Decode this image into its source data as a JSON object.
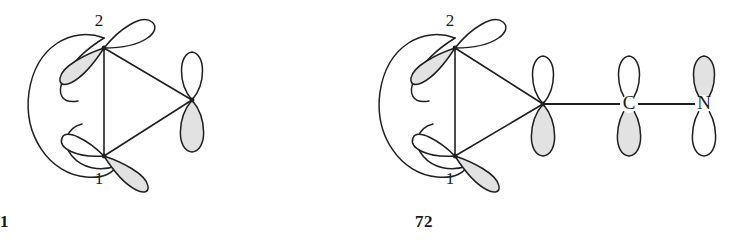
{
  "figure": {
    "background_color": "#ffffff",
    "line_color": "#1f1f1f",
    "lobe_shade_color": "#e2e2e2",
    "lobe_empty_color": "#ffffff"
  },
  "structures": [
    {
      "id": "71",
      "caption": "71",
      "description": "Three-membered ring with p-orbitals at each vertex and an outer orbital envelope on the left",
      "position_labels": [
        {
          "text": "2",
          "vertex": "top-left"
        },
        {
          "text": "1",
          "vertex": "bottom-left"
        }
      ],
      "vertices": [
        {
          "name": "vertex-2",
          "label": "2",
          "orbital": "p",
          "orientation": "tilted",
          "shaded_lobe": "lower-left",
          "empty_lobe": "upper-right"
        },
        {
          "name": "vertex-1",
          "label": "1",
          "orbital": "p",
          "orientation": "tilted",
          "shaded_lobe": "lower-right",
          "empty_lobe": "upper-left"
        },
        {
          "name": "vertex-right",
          "label": "",
          "orbital": "p",
          "orientation": "vertical",
          "shaded_lobe": "bottom",
          "empty_lobe": "top"
        }
      ],
      "bonds": [
        {
          "from": "vertex-2",
          "to": "vertex-1",
          "kind": "ring"
        },
        {
          "from": "vertex-2",
          "to": "vertex-right",
          "kind": "ring"
        },
        {
          "from": "vertex-1",
          "to": "vertex-right",
          "kind": "ring"
        }
      ],
      "envelope": "left-side closed orbital envelope enclosing the back lobes of vertices 1 and 2"
    },
    {
      "id": "72",
      "caption": "72",
      "description": "Three-membered ring as in 71, with the right vertex bonded through a chain to C and then N, each bearing a vertical p-orbital",
      "position_labels": [
        {
          "text": "2",
          "vertex": "top-left"
        },
        {
          "text": "1",
          "vertex": "bottom-left"
        }
      ],
      "vertices": [
        {
          "name": "vertex-2",
          "label": "2",
          "orbital": "p",
          "orientation": "tilted",
          "shaded_lobe": "lower-left",
          "empty_lobe": "upper-right"
        },
        {
          "name": "vertex-1",
          "label": "1",
          "orbital": "p",
          "orientation": "tilted",
          "shaded_lobe": "lower-right",
          "empty_lobe": "upper-left"
        },
        {
          "name": "vertex-right",
          "label": "",
          "orbital": "p",
          "orientation": "vertical",
          "shaded_lobe": "bottom",
          "empty_lobe": "top"
        },
        {
          "name": "atom-carbon",
          "label": "C",
          "orbital": "p",
          "orientation": "vertical",
          "shaded_lobe": "bottom",
          "empty_lobe": "top"
        },
        {
          "name": "atom-nitrogen",
          "label": "N",
          "orbital": "p",
          "orientation": "vertical",
          "shaded_lobe": "top",
          "empty_lobe": "bottom"
        }
      ],
      "bonds": [
        {
          "from": "vertex-2",
          "to": "vertex-1",
          "kind": "ring"
        },
        {
          "from": "vertex-2",
          "to": "vertex-right",
          "kind": "ring"
        },
        {
          "from": "vertex-1",
          "to": "vertex-right",
          "kind": "ring"
        },
        {
          "from": "vertex-right",
          "to": "atom-carbon",
          "kind": "chain"
        },
        {
          "from": "atom-carbon",
          "to": "atom-nitrogen",
          "kind": "chain"
        }
      ],
      "envelope": "left-side closed orbital envelope enclosing the back lobes of vertices 1 and 2"
    }
  ]
}
